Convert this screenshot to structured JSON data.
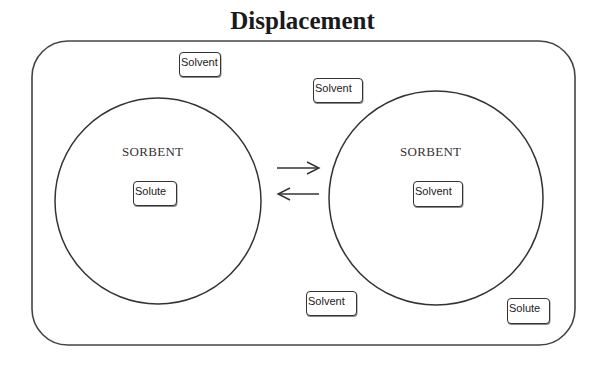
{
  "title": "Displacement",
  "left_sorbent": {
    "label": "SORBENT",
    "contents": "Solute"
  },
  "right_sorbent": {
    "label": "SORBENT",
    "contents": "Solvent"
  },
  "free_molecules": [
    {
      "label": "Solvent"
    },
    {
      "label": "Solvent"
    },
    {
      "label": "Solvent"
    },
    {
      "label": "Solute"
    }
  ],
  "equilibrium": {
    "forward_arrow": "right-arrow",
    "reverse_arrow": "left-arrow"
  },
  "colors": {
    "line": "#333333",
    "background": "#ffffff"
  }
}
